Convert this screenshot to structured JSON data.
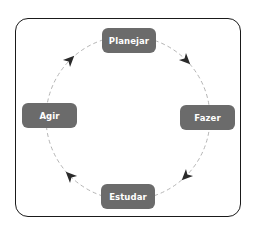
{
  "diagram": {
    "type": "cycle",
    "direction": "clockwise",
    "nodes": [
      {
        "id": "planejar",
        "label": "Planejar",
        "position": "top"
      },
      {
        "id": "fazer",
        "label": "Fazer",
        "position": "right"
      },
      {
        "id": "estudar",
        "label": "Estudar",
        "position": "bottom"
      },
      {
        "id": "agir",
        "label": "Agir",
        "position": "left"
      }
    ],
    "edges": [
      {
        "from": "planejar",
        "to": "fazer",
        "style": "dashed"
      },
      {
        "from": "fazer",
        "to": "estudar",
        "style": "dashed"
      },
      {
        "from": "estudar",
        "to": "agir",
        "style": "dashed"
      },
      {
        "from": "agir",
        "to": "planejar",
        "style": "dashed"
      }
    ],
    "colors": {
      "node_fill": "#6b6b6b",
      "node_text": "#ffffff",
      "frame_border": "#1a1a1a",
      "dash_line": "#b5b5b5",
      "arrowhead": "#2a2a2a"
    }
  }
}
